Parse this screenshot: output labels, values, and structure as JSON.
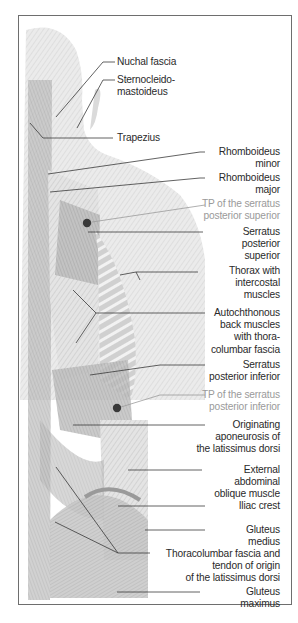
{
  "figure": {
    "frame_color": "#6e6e6e",
    "label_color": "#2a2a2a",
    "trigger_point_color": "#9a9a9a",
    "marker_color": "#3a3a3a"
  },
  "labels": [
    {
      "id": "nuchal-fascia",
      "text": "Nuchal fascia",
      "kind": "structure",
      "left": true
    },
    {
      "id": "sternocleidomastoideus",
      "text": "Sternocleido-\nmastoideus",
      "kind": "structure",
      "left": true
    },
    {
      "id": "trapezius",
      "text": "Trapezius",
      "kind": "structure",
      "left": true
    },
    {
      "id": "rhomboideus-minor",
      "text": "Rhomboideus\nminor",
      "kind": "structure"
    },
    {
      "id": "rhomboideus-major",
      "text": "Rhomboideus\nmajor",
      "kind": "structure"
    },
    {
      "id": "tp-serratus-posterior-superior",
      "text": "TP of the serratus\nposterior superior",
      "kind": "trigger-point"
    },
    {
      "id": "serratus-posterior-superior",
      "text": "Serratus\nposterior\nsuperior",
      "kind": "structure"
    },
    {
      "id": "thorax-intercostal",
      "text": "Thorax with\nintercostal\nmuscles",
      "kind": "structure"
    },
    {
      "id": "autochthonous-back-muscles",
      "text": "Autochthonous\nback muscles\nwith thora-\ncolumbar fascia",
      "kind": "structure"
    },
    {
      "id": "serratus-posterior-inferior",
      "text": "Serratus\nposterior inferior",
      "kind": "structure"
    },
    {
      "id": "tp-serratus-posterior-inferior",
      "text": "TP of the serratus\nposterior inferior",
      "kind": "trigger-point"
    },
    {
      "id": "latissimus-aponeurosis",
      "text": "Originating\naponeurosis of\nthe latissimus dorsi",
      "kind": "structure"
    },
    {
      "id": "external-abdominal-oblique",
      "text": "External\nabdominal\noblique muscle",
      "kind": "structure"
    },
    {
      "id": "iliac-crest",
      "text": "Iliac crest",
      "kind": "structure"
    },
    {
      "id": "gluteus-medius",
      "text": "Gluteus\nmedius",
      "kind": "structure"
    },
    {
      "id": "thoracolumbar-fascia-tendon",
      "text": "Thoracolumbar fascia and\ntendon of origin\nof the latissimus dorsi",
      "kind": "structure"
    },
    {
      "id": "gluteus-maximus",
      "text": "Gluteus\nmaximus",
      "kind": "structure"
    }
  ]
}
